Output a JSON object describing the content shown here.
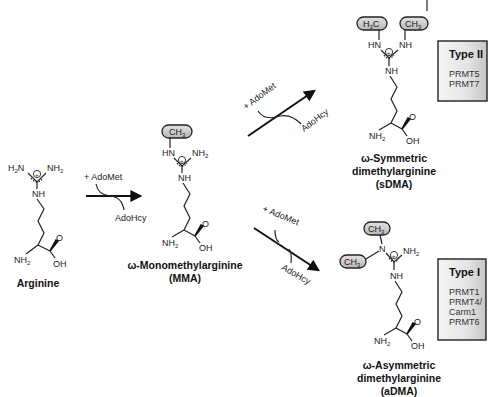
{
  "diagram": {
    "type": "reaction-scheme",
    "colors": {
      "line": "#222222",
      "methyl_pill_fill": "#c8c8c8",
      "box_fill_light": "#f4f4f4",
      "box_fill_dark": "#c9c9c9",
      "text": "#111111"
    }
  },
  "labels": {
    "ch3": "CH",
    "h3c_h": "H",
    "h3c_c": "C",
    "three": "3",
    "two": "2",
    "h2n_h": "H",
    "h2n_n": "N",
    "nh2_nh": "NH",
    "nh": "NH",
    "hn": "HN",
    "n": "N",
    "o": "O",
    "oh": "OH",
    "charge": "+"
  },
  "molecules": {
    "arginine": {
      "name": "Arginine"
    },
    "mma": {
      "name_line1": "ω-Monomethylarginine",
      "name_line2": "(MMA)"
    },
    "sdma": {
      "name_line1": "ω-Symmetric",
      "name_line2": "dimethylarginine",
      "name_line3": "(sDMA)"
    },
    "adma": {
      "name_line1": "ω-Asymmetric",
      "name_line2": "dimethylarginine",
      "name_line3": "(aDMA)"
    }
  },
  "reactions": {
    "step1": {
      "reagent_in": "+ AdoMet",
      "reagent_out": "AdoHcy"
    },
    "step2_symmetric": {
      "reagent_in": "+ AdoMet",
      "reagent_out": "AdoHcy"
    },
    "step2_asymmetric": {
      "reagent_in": "+ AdoMet",
      "reagent_out": "AdoHcy"
    }
  },
  "enzyme_boxes": {
    "type2": {
      "title": "Type II",
      "items": [
        "PRMT5",
        "PRMT7"
      ]
    },
    "type1": {
      "title": "Type I",
      "items": [
        "PRMT1",
        "PRMT4/",
        "Carm1",
        "PRMT6"
      ]
    }
  }
}
